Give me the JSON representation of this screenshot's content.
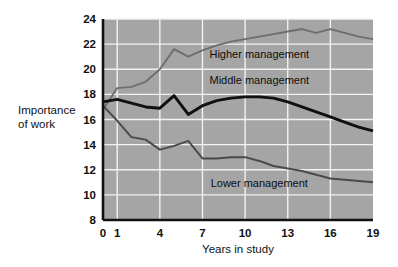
{
  "chart_data": {
    "type": "line",
    "title": "",
    "xlabel": "Years in study",
    "ylabel": "Importance of work",
    "ylabel_line1": "Importance",
    "ylabel_line2": "of work",
    "xlim": [
      0,
      19
    ],
    "ylim": [
      8,
      24
    ],
    "xticks": [
      0,
      1,
      4,
      7,
      10,
      13,
      16,
      19
    ],
    "xtick_labels": [
      "0",
      "1",
      "4",
      "7",
      "10",
      "13",
      "16",
      "19"
    ],
    "yticks": [
      8,
      10,
      12,
      14,
      16,
      18,
      20,
      22,
      24
    ],
    "ytick_labels": [
      "8",
      "10",
      "12",
      "14",
      "16",
      "18",
      "20",
      "22",
      "24"
    ],
    "grid": true,
    "grid_color": "#f2f2f2",
    "plot_background": "#a5a5a5",
    "legend_position": "inline-annotation",
    "x": [
      0,
      1,
      2,
      3,
      4,
      5,
      6,
      7,
      8,
      9,
      10,
      11,
      12,
      13,
      14,
      15,
      16,
      17,
      18,
      19
    ],
    "series": [
      {
        "name": "Higher management",
        "color": "#6e6e6e",
        "label_x": 11.0,
        "label_y": 20.9,
        "values": [
          16.8,
          18.5,
          18.6,
          19.0,
          20.0,
          21.6,
          21.0,
          21.5,
          21.9,
          22.2,
          22.4,
          22.6,
          22.8,
          23.0,
          23.2,
          22.9,
          23.2,
          22.9,
          22.6,
          22.4
        ]
      },
      {
        "name": "Middle management",
        "color": "#101010",
        "label_x": 11.0,
        "label_y": 18.8,
        "values": [
          17.4,
          17.6,
          17.3,
          17.0,
          16.9,
          17.9,
          16.4,
          17.1,
          17.5,
          17.7,
          17.8,
          17.8,
          17.7,
          17.4,
          17.0,
          16.6,
          16.2,
          15.8,
          15.4,
          15.1
        ]
      },
      {
        "name": "Lower management",
        "color": "#4a4a4a",
        "label_x": 11.0,
        "label_y": 10.6,
        "values": [
          17.1,
          15.9,
          14.6,
          14.4,
          13.6,
          13.9,
          14.3,
          12.9,
          12.9,
          13.0,
          13.0,
          12.7,
          12.3,
          12.1,
          11.9,
          11.6,
          11.3,
          11.2,
          11.1,
          11.0
        ]
      }
    ]
  }
}
